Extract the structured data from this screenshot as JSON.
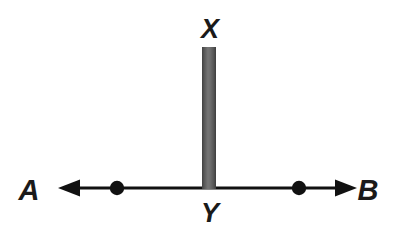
{
  "figure": {
    "type": "geometry-diagram",
    "background_color": "#ffffff",
    "stroke_color": "#111111",
    "bar_color_dark": "#4b4b4b",
    "bar_color_light": "#7d7d7d",
    "labels": {
      "top": "X",
      "bottom": "Y",
      "left": "A",
      "right": "B"
    },
    "line": {
      "name": "line-AB",
      "y": 188,
      "x_start": 58,
      "x_end": 357,
      "thickness": 3,
      "arrow_left": true,
      "arrow_right": true
    },
    "points": [
      {
        "name": "point-left",
        "x": 117,
        "y": 188,
        "radius": 7
      },
      {
        "name": "point-right",
        "x": 299,
        "y": 188,
        "radius": 7
      }
    ],
    "segment": {
      "name": "segment-XY",
      "x": 202,
      "width": 14,
      "y_top": 47,
      "y_bottom": 189
    },
    "label_positions": {
      "X": {
        "x": 210,
        "y": 38
      },
      "Y": {
        "x": 210,
        "y": 222
      },
      "A": {
        "x": 29,
        "y": 200
      },
      "B": {
        "x": 368,
        "y": 200
      }
    }
  }
}
